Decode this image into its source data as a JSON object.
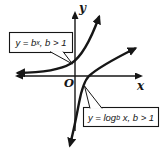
{
  "figure": {
    "background_color": "#ffffff",
    "ink_color": "#161616"
  },
  "axes": {
    "y_label": "y",
    "x_label": "x",
    "origin_label": "O"
  },
  "callouts": {
    "exponential": {
      "pre": "y = b",
      "sup": "x",
      "post": ", b > 1"
    },
    "logarithmic": {
      "pre": "y = log",
      "sub": "b",
      "post": " x, b > 1"
    }
  }
}
